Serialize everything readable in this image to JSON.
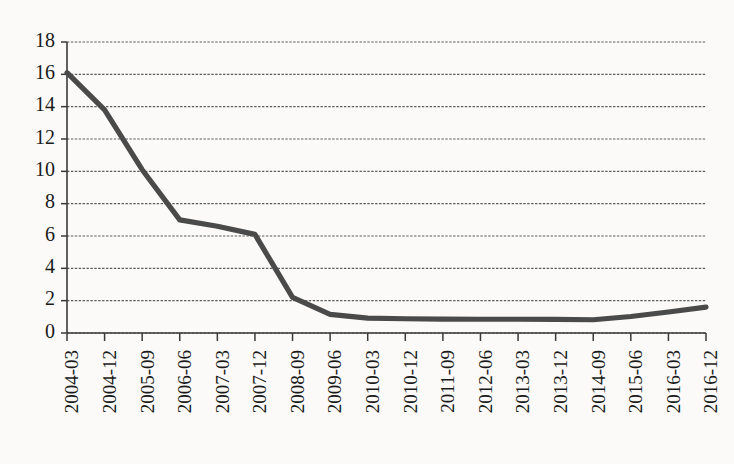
{
  "chart_data": {
    "type": "line",
    "title": "",
    "subtitle": "",
    "xlabel": "",
    "ylabel": "",
    "legend": [],
    "legend_position": "none",
    "grid": true,
    "grid_axis": "y",
    "grid_style": "dashed",
    "ylim": [
      0,
      18
    ],
    "ytick_step": 2,
    "ytick_labels": [
      "0",
      "2",
      "4",
      "6",
      "8",
      "10",
      "12",
      "14",
      "16",
      "18"
    ],
    "ytick_values": [
      0,
      2,
      4,
      6,
      8,
      10,
      12,
      14,
      16,
      18
    ],
    "xtick_labels": [
      "2004-03",
      "2004-12",
      "2005-09",
      "2006-06",
      "2007-03",
      "2007-12",
      "2008-09",
      "2009-06",
      "2010-03",
      "2010-12",
      "2011-09",
      "2012-06",
      "2013-03",
      "2013-12",
      "2014-09",
      "2015-06",
      "2016-03",
      "2016-12"
    ],
    "xtick_rotation": 90,
    "x_interval_months": 9,
    "categories": [
      "2004-03",
      "2004-12",
      "2005-09",
      "2006-06",
      "2007-03",
      "2007-12",
      "2008-09",
      "2009-06",
      "2010-03",
      "2010-12",
      "2011-09",
      "2012-06",
      "2013-03",
      "2013-12",
      "2014-09",
      "2015-06",
      "2016-03",
      "2016-12"
    ],
    "values": [
      16.1,
      13.8,
      10.1,
      7.0,
      6.6,
      6.1,
      2.2,
      1.15,
      0.92,
      0.88,
      0.86,
      0.85,
      0.85,
      0.84,
      0.82,
      1.02,
      1.3,
      1.6
    ],
    "series": [
      {
        "name": "series-1",
        "color": "#4a4a4a",
        "values": [
          16.1,
          13.8,
          10.1,
          7.0,
          6.6,
          6.1,
          2.2,
          1.15,
          0.92,
          0.88,
          0.86,
          0.85,
          0.85,
          0.84,
          0.82,
          1.02,
          1.3,
          1.6
        ]
      }
    ],
    "colors": {
      "line": "#4a4a4a",
      "grid": "#5d5d5d",
      "axis": "#3a3a3a",
      "text": "#1a1a1a",
      "background": "#fbfaf8"
    }
  }
}
